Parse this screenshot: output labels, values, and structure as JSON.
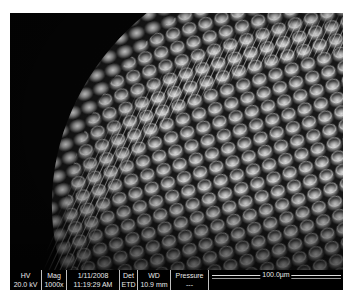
{
  "image": {
    "subject": "SEM micrograph of insect compound eye with ommatidia and sensory hairs",
    "colors": {
      "background": "#000000",
      "databar_text": "#e8e8e8",
      "page": "#ffffff"
    }
  },
  "databar": {
    "hv": {
      "label": "HV",
      "value": "20.0 kV"
    },
    "mag": {
      "label": "Mag",
      "value": "1000x"
    },
    "date": {
      "label": "1/11/2008",
      "value": "11:19:29 AM"
    },
    "det": {
      "label": "Det",
      "value": "ETD"
    },
    "wd": {
      "label": "WD",
      "value": "10.9 mm"
    },
    "pressure": {
      "label": "Pressure",
      "value": "---"
    },
    "scale_bar": {
      "label": "100.0µm"
    }
  }
}
